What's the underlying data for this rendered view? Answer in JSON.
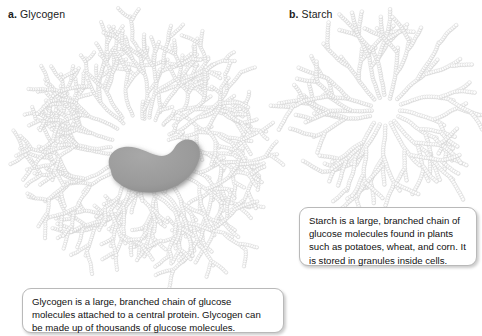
{
  "background_color": "#ffffff",
  "text_color": "#111111",
  "panels": [
    {
      "marker": "a.",
      "name": "Glycogen",
      "diagram": "glycogen-branched-chain-diagram",
      "caption": "Glycogen is a large, branched chain of glucose molecules attached to a central protein. Glycogen can be made up of thousands of glucose molecules."
    },
    {
      "marker": "b.",
      "name": "Starch",
      "diagram": "starch-branched-chain-diagram",
      "caption": "Starch is a large, branched chain of glucose molecules found in plants such as potatoes, wheat, and corn. It is stored in granules inside cells."
    }
  ],
  "diagram_colors": {
    "glucose_bead_fill": "#ffffff",
    "glucose_bead_edge": "#d2d2d2",
    "glucose_bead_shade": "#e8e8e8",
    "central_protein_fill": "#9a9a9a",
    "central_protein_shadow": "#6f6f6f",
    "caption_border": "#b9b9b9"
  },
  "glycogen_structure": {
    "center_x": 146,
    "center_y": 128,
    "primary_branches": 26,
    "has_central_protein": true,
    "protein_label": "central protein",
    "protein_shape": "kidney-blob"
  },
  "starch_structure": {
    "center_x": 97,
    "center_y": 97,
    "primary_branches": 16,
    "has_central_protein": false
  }
}
